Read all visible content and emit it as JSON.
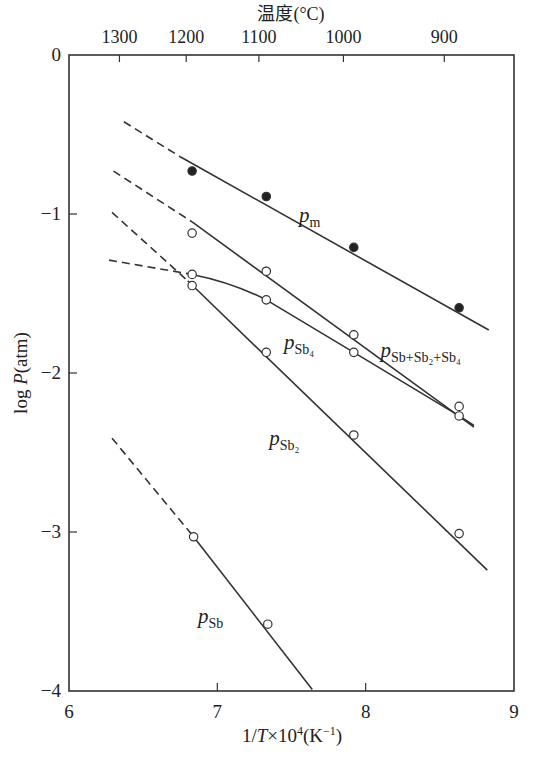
{
  "chart_data": {
    "type": "line",
    "title": "",
    "xlabel": "1/T×10⁴ (K⁻¹)",
    "ylabel": "log P (atm)",
    "top_axis_label": "温度(°C)",
    "xlim": [
      6,
      9
    ],
    "ylim": [
      -4,
      0
    ],
    "x_ticks": [
      6,
      7,
      8,
      9
    ],
    "y_ticks": [
      0,
      -1,
      -2,
      -3,
      -4
    ],
    "y_tick_labels": [
      "0",
      "−1",
      "−2",
      "−3",
      "−4"
    ],
    "top_ticks": [
      {
        "label": "1300",
        "x": 6.34
      },
      {
        "label": "1200",
        "x": 6.79
      },
      {
        "label": "1100",
        "x": 7.28
      },
      {
        "label": "1000",
        "x": 7.85
      },
      {
        "label": "900",
        "x": 8.53
      }
    ],
    "grid": false,
    "series": [
      {
        "name": "p_m",
        "label_main": "p",
        "label_sub": "m",
        "marker": "filled",
        "points": [
          {
            "x": 6.83,
            "y": -0.73
          },
          {
            "x": 7.33,
            "y": -0.89
          },
          {
            "x": 7.92,
            "y": -1.21
          },
          {
            "x": 8.63,
            "y": -1.59
          }
        ],
        "dashed": [
          {
            "x": 6.37,
            "y": -0.42
          },
          {
            "x": 6.75,
            "y": -0.64
          }
        ],
        "solid": [
          {
            "x": 6.75,
            "y": -0.64
          },
          {
            "x": 8.83,
            "y": -1.73
          }
        ],
        "label_pos": {
          "x": 7.55,
          "y": -1.05
        }
      },
      {
        "name": "p_Sb+Sb2+Sb4",
        "label_main": "p",
        "label_sub": "Sb+Sb₂+Sb₄",
        "marker": "open",
        "points": [
          {
            "x": 6.83,
            "y": -1.12
          },
          {
            "x": 7.33,
            "y": -1.36
          },
          {
            "x": 7.92,
            "y": -1.76
          },
          {
            "x": 8.63,
            "y": -2.21
          }
        ],
        "dashed": [
          {
            "x": 6.3,
            "y": -0.73
          },
          {
            "x": 6.83,
            "y": -1.05
          }
        ],
        "solid": [
          {
            "x": 6.83,
            "y": -1.05
          },
          {
            "x": 8.73,
            "y": -2.34
          }
        ],
        "label_pos": {
          "x": 8.1,
          "y": -1.9
        }
      },
      {
        "name": "p_Sb4",
        "label_main": "p",
        "label_sub": "Sb₄",
        "marker": "open",
        "points": [
          {
            "x": 6.83,
            "y": -1.38
          },
          {
            "x": 7.33,
            "y": -1.54
          },
          {
            "x": 7.92,
            "y": -1.87
          },
          {
            "x": 8.63,
            "y": -2.27
          }
        ],
        "dashed": [
          {
            "x": 6.27,
            "y": -1.29
          },
          {
            "x": 6.83,
            "y": -1.38
          }
        ],
        "solid": [
          {
            "x": 6.83,
            "y": -1.38
          },
          {
            "x": 7.1,
            "y": -1.43
          },
          {
            "x": 7.33,
            "y": -1.54
          },
          {
            "x": 7.92,
            "y": -1.87
          },
          {
            "x": 8.63,
            "y": -2.27
          },
          {
            "x": 8.63,
            "y": -2.27
          },
          {
            "x": 8.73,
            "y": -2.33
          }
        ],
        "label_pos": {
          "x": 7.45,
          "y": -1.85
        }
      },
      {
        "name": "p_Sb2",
        "label_main": "p",
        "label_sub": "Sb₂",
        "marker": "open",
        "points": [
          {
            "x": 6.83,
            "y": -1.45
          },
          {
            "x": 7.33,
            "y": -1.87
          },
          {
            "x": 7.92,
            "y": -2.39
          },
          {
            "x": 8.63,
            "y": -3.01
          }
        ],
        "dashed": [
          {
            "x": 6.29,
            "y": -0.99
          },
          {
            "x": 6.8,
            "y": -1.42
          }
        ],
        "solid": [
          {
            "x": 6.8,
            "y": -1.42
          },
          {
            "x": 8.82,
            "y": -3.24
          }
        ],
        "label_pos": {
          "x": 7.35,
          "y": -2.45
        }
      },
      {
        "name": "p_Sb",
        "label_main": "p",
        "label_sub": "Sb",
        "marker": "open",
        "points": [
          {
            "x": 6.84,
            "y": -3.03
          },
          {
            "x": 7.34,
            "y": -3.58
          }
        ],
        "dashed": [
          {
            "x": 6.29,
            "y": -2.41
          },
          {
            "x": 6.84,
            "y": -3.03
          }
        ],
        "solid": [
          {
            "x": 6.84,
            "y": -3.03
          },
          {
            "x": 7.64,
            "y": -3.99
          }
        ],
        "label_pos": {
          "x": 6.87,
          "y": -3.57
        }
      }
    ]
  }
}
